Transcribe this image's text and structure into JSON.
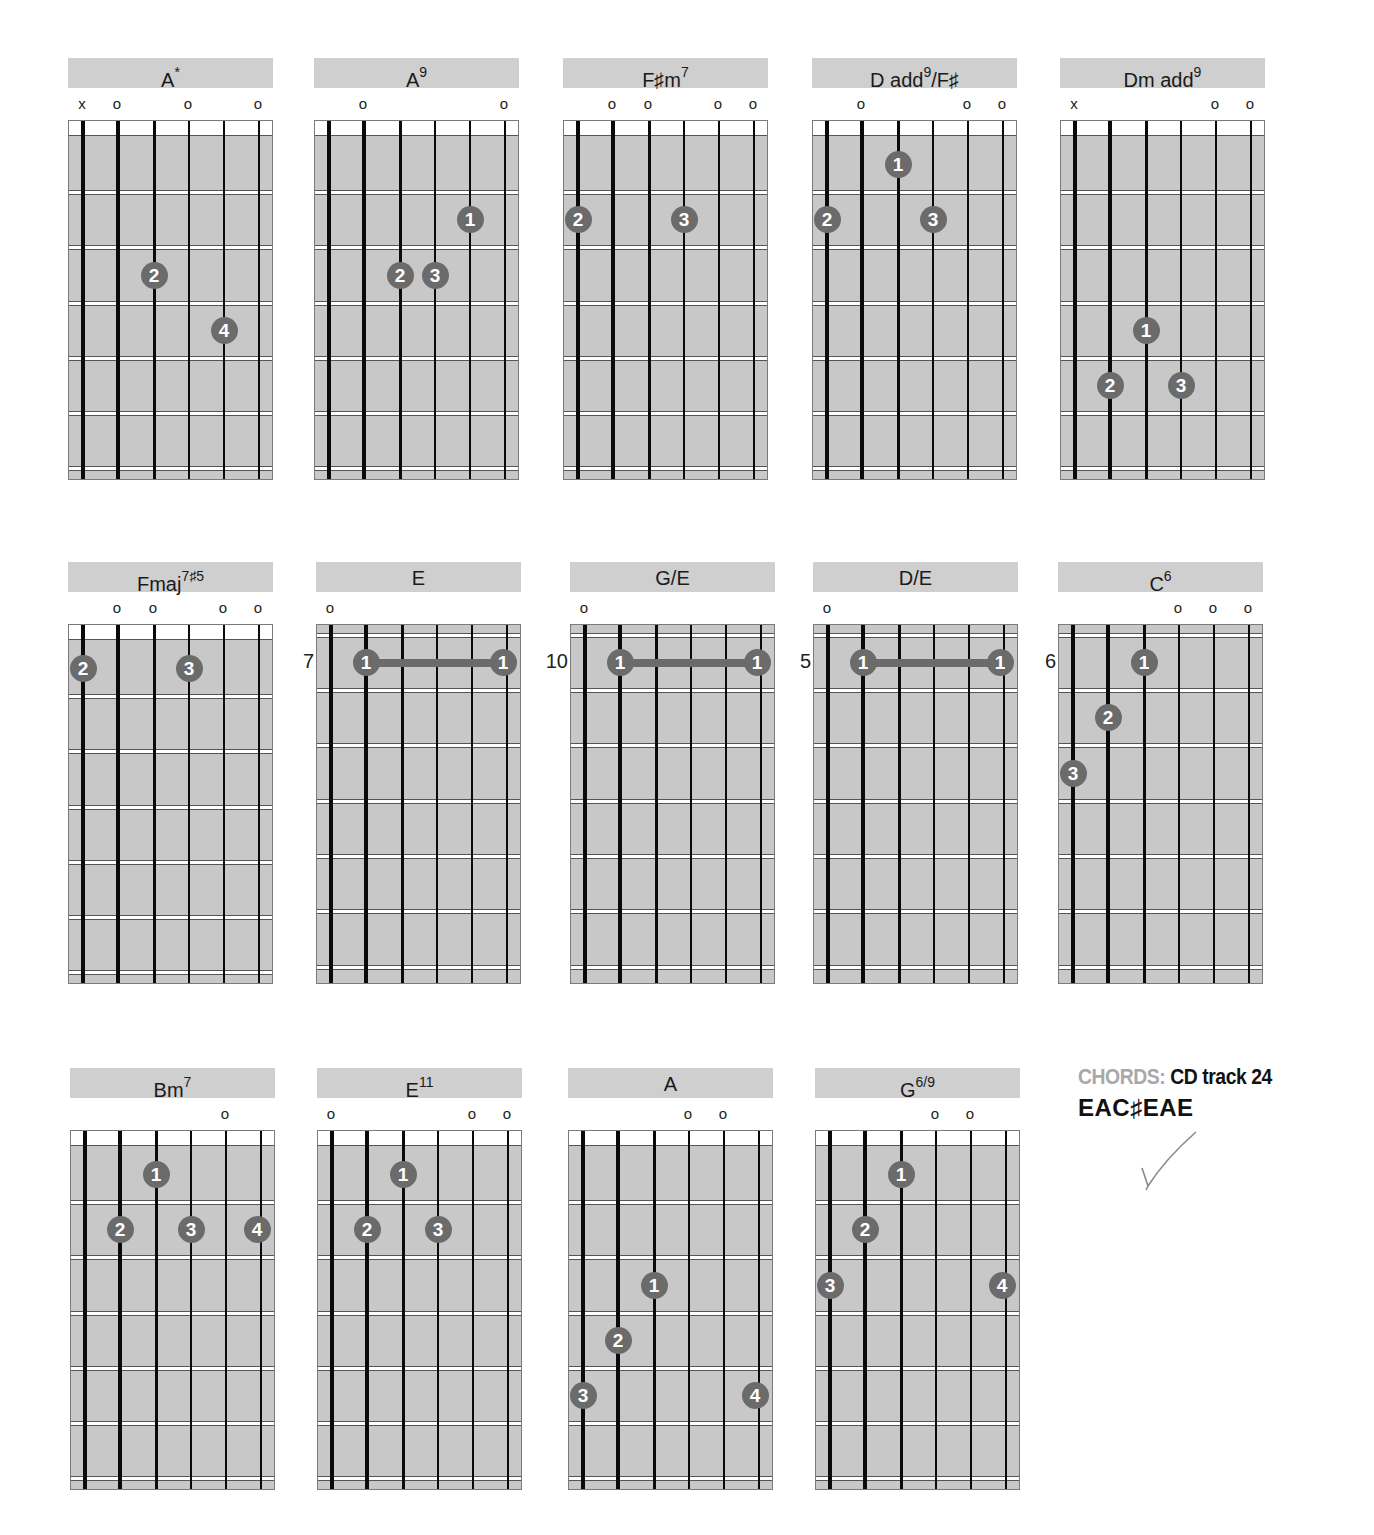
{
  "page": {
    "width": 1374,
    "height": 1535,
    "colors": {
      "header_bar": "#cfcfcf",
      "fretboard": "#c8c8c8",
      "fret_line": "#ffffff",
      "string": "#0a0a0a",
      "finger_dot": "#6b6b6b",
      "finger_text": "#ffffff",
      "caption_label": "#a8a8a8",
      "caption_value": "#111111"
    }
  },
  "caption": {
    "label": "CHORDS:",
    "value": "CD track 24",
    "tuning": "EAC♯EAE"
  },
  "chords": [
    {
      "id": "a-star",
      "name": "A",
      "sup": "*",
      "x": 68,
      "y": 58,
      "position": null,
      "markers": [
        "x",
        "o",
        "",
        "o",
        "",
        "o"
      ],
      "dots": [
        {
          "string": 3,
          "fret": 3,
          "finger": "2"
        },
        {
          "string": 5,
          "fret": 4,
          "finger": "4"
        }
      ],
      "barres": []
    },
    {
      "id": "a9",
      "name": "A",
      "sup": "9",
      "x": 314,
      "y": 58,
      "position": null,
      "markers": [
        "",
        "o",
        "",
        "",
        "",
        "o"
      ],
      "dots": [
        {
          "string": 5,
          "fret": 2,
          "finger": "1"
        },
        {
          "string": 3,
          "fret": 3,
          "finger": "2"
        },
        {
          "string": 4,
          "fret": 3,
          "finger": "3"
        }
      ],
      "barres": []
    },
    {
      "id": "fsharp-m7",
      "name": "F♯m",
      "sup": "7",
      "x": 563,
      "y": 58,
      "position": null,
      "markers": [
        "",
        "o",
        "o",
        "",
        "o",
        "o"
      ],
      "dots": [
        {
          "string": 1,
          "fret": 2,
          "finger": "2"
        },
        {
          "string": 4,
          "fret": 2,
          "finger": "3"
        }
      ],
      "barres": []
    },
    {
      "id": "d-add9-fsharp",
      "name": "D add",
      "sup": "9",
      "suffix": "/F♯",
      "x": 812,
      "y": 58,
      "position": null,
      "markers": [
        "",
        "o",
        "",
        "",
        "o",
        "o"
      ],
      "dots": [
        {
          "string": 3,
          "fret": 1,
          "finger": "1"
        },
        {
          "string": 1,
          "fret": 2,
          "finger": "2"
        },
        {
          "string": 4,
          "fret": 2,
          "finger": "3"
        }
      ],
      "barres": []
    },
    {
      "id": "dm-add9",
      "name": "Dm add",
      "sup": "9",
      "x": 1060,
      "y": 58,
      "position": null,
      "markers": [
        "x",
        "",
        "",
        "",
        "o",
        "o"
      ],
      "dots": [
        {
          "string": 3,
          "fret": 4,
          "finger": "1"
        },
        {
          "string": 2,
          "fret": 5,
          "finger": "2"
        },
        {
          "string": 4,
          "fret": 5,
          "finger": "3"
        }
      ],
      "barres": []
    },
    {
      "id": "fmaj7sharp5",
      "name": "Fmaj",
      "sup": "7♯5",
      "x": 68,
      "y": 562,
      "position": null,
      "markers": [
        "",
        "o",
        "o",
        "",
        "o",
        "o"
      ],
      "dots": [
        {
          "string": 1,
          "fret": 1,
          "finger": "2"
        },
        {
          "string": 4,
          "fret": 1,
          "finger": "3"
        }
      ],
      "barres": []
    },
    {
      "id": "e",
      "name": "E",
      "sup": "",
      "x": 316,
      "y": 562,
      "position": "7",
      "markers": [
        "o",
        "",
        "",
        "",
        "",
        ""
      ],
      "dots": [
        {
          "string": 2,
          "fret": 1,
          "finger": "1"
        },
        {
          "string": 6,
          "fret": 1,
          "finger": "1"
        }
      ],
      "barres": [
        {
          "from": 2,
          "to": 6,
          "fret": 1
        }
      ]
    },
    {
      "id": "g-over-e",
      "name": "G/E",
      "sup": "",
      "x": 570,
      "y": 562,
      "position": "10",
      "markers": [
        "o",
        "",
        "",
        "",
        "",
        ""
      ],
      "dots": [
        {
          "string": 2,
          "fret": 1,
          "finger": "1"
        },
        {
          "string": 6,
          "fret": 1,
          "finger": "1"
        }
      ],
      "barres": [
        {
          "from": 2,
          "to": 6,
          "fret": 1
        }
      ]
    },
    {
      "id": "d-over-e",
      "name": "D/E",
      "sup": "",
      "x": 813,
      "y": 562,
      "position": "5",
      "markers": [
        "o",
        "",
        "",
        "",
        "",
        ""
      ],
      "dots": [
        {
          "string": 2,
          "fret": 1,
          "finger": "1"
        },
        {
          "string": 6,
          "fret": 1,
          "finger": "1"
        }
      ],
      "barres": [
        {
          "from": 2,
          "to": 6,
          "fret": 1
        }
      ]
    },
    {
      "id": "c6",
      "name": "C",
      "sup": "6",
      "x": 1058,
      "y": 562,
      "position": "6",
      "markers": [
        "",
        "",
        "",
        "o",
        "o",
        "o"
      ],
      "dots": [
        {
          "string": 3,
          "fret": 1,
          "finger": "1"
        },
        {
          "string": 2,
          "fret": 2,
          "finger": "2"
        },
        {
          "string": 1,
          "fret": 3,
          "finger": "3"
        }
      ],
      "barres": []
    },
    {
      "id": "bm7",
      "name": "Bm",
      "sup": "7",
      "x": 70,
      "y": 1068,
      "position": null,
      "markers": [
        "",
        "",
        "",
        "",
        "o",
        ""
      ],
      "dots": [
        {
          "string": 3,
          "fret": 1,
          "finger": "1"
        },
        {
          "string": 2,
          "fret": 2,
          "finger": "2"
        },
        {
          "string": 4,
          "fret": 2,
          "finger": "3"
        },
        {
          "string": 6,
          "fret": 2,
          "finger": "4"
        }
      ],
      "barres": []
    },
    {
      "id": "e11",
      "name": "E",
      "sup": "11",
      "x": 317,
      "y": 1068,
      "position": null,
      "markers": [
        "o",
        "",
        "",
        "",
        "o",
        "o"
      ],
      "dots": [
        {
          "string": 3,
          "fret": 1,
          "finger": "1"
        },
        {
          "string": 2,
          "fret": 2,
          "finger": "2"
        },
        {
          "string": 4,
          "fret": 2,
          "finger": "3"
        }
      ],
      "barres": []
    },
    {
      "id": "a",
      "name": "A",
      "sup": "",
      "x": 568,
      "y": 1068,
      "position": null,
      "markers": [
        "",
        "",
        "",
        "o",
        "o",
        ""
      ],
      "dots": [
        {
          "string": 3,
          "fret": 3,
          "finger": "1"
        },
        {
          "string": 2,
          "fret": 4,
          "finger": "2"
        },
        {
          "string": 1,
          "fret": 5,
          "finger": "3"
        },
        {
          "string": 6,
          "fret": 5,
          "finger": "4"
        }
      ],
      "barres": []
    },
    {
      "id": "g6-9",
      "name": "G",
      "sup": "6/9",
      "x": 815,
      "y": 1068,
      "position": null,
      "markers": [
        "",
        "",
        "",
        "o",
        "o",
        ""
      ],
      "dots": [
        {
          "string": 3,
          "fret": 1,
          "finger": "1"
        },
        {
          "string": 2,
          "fret": 2,
          "finger": "2"
        },
        {
          "string": 1,
          "fret": 3,
          "finger": "3"
        },
        {
          "string": 6,
          "fret": 3,
          "finger": "4"
        }
      ],
      "barres": []
    }
  ]
}
